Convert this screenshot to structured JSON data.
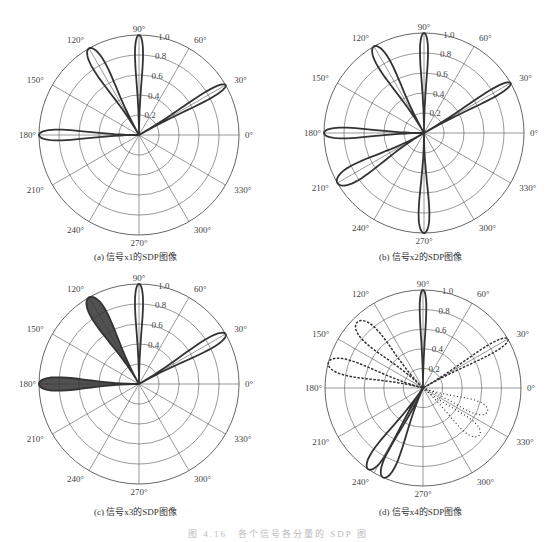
{
  "figure_caption": "图 4.16　各个信号各分量的 SDP 图",
  "chart_data": [
    {
      "type": "polar",
      "id": "a",
      "title": "(a) 信号x1的SDP图像",
      "center": [
        139,
        135
      ],
      "radius": 100,
      "angle_ticks": [
        "0°",
        "30°",
        "60°",
        "90°",
        "120°",
        "150°",
        "180°",
        "210°",
        "240°",
        "270°",
        "300°",
        "330°"
      ],
      "radial_ticks": [
        "0.2",
        "0.4",
        "0.6",
        "0.8",
        "1.0"
      ],
      "rlim": [
        0,
        1.0
      ],
      "lobes": [
        {
          "angle": 90,
          "r": 1.0,
          "width": 6,
          "style": "solid"
        },
        {
          "angle": 120,
          "r": 1.0,
          "width": 10,
          "style": "solid"
        },
        {
          "angle": 30,
          "r": 1.0,
          "width": 6,
          "style": "solid"
        },
        {
          "angle": 180,
          "r": 1.0,
          "width": 8,
          "style": "solid"
        }
      ]
    },
    {
      "type": "polar",
      "id": "b",
      "title": "(b) 信号x2的SDP图像",
      "center": [
        424,
        133
      ],
      "radius": 100,
      "angle_ticks": [
        "0°",
        "30°",
        "60°",
        "90°",
        "120°",
        "150°",
        "180°",
        "210°",
        "240°",
        "270°",
        "300°",
        "330°"
      ],
      "radial_ticks": [
        "0.2",
        "0.4",
        "0.6",
        "0.8",
        "1.0"
      ],
      "rlim": [
        0,
        1.0
      ],
      "lobes": [
        {
          "angle": 90,
          "r": 1.0,
          "width": 6,
          "style": "solid"
        },
        {
          "angle": 120,
          "r": 1.0,
          "width": 10,
          "style": "solid"
        },
        {
          "angle": 30,
          "r": 1.0,
          "width": 6,
          "style": "solid"
        },
        {
          "angle": 180,
          "r": 1.0,
          "width": 8,
          "style": "solid"
        },
        {
          "angle": 210,
          "r": 1.0,
          "width": 12,
          "style": "solid"
        },
        {
          "angle": 270,
          "r": 1.0,
          "width": 8,
          "style": "solid"
        }
      ]
    },
    {
      "type": "polar",
      "id": "c",
      "title": "(c) 信号x3的SDP图像",
      "center": [
        139,
        384
      ],
      "radius": 100,
      "angle_ticks": [
        "0°",
        "30°",
        "60°",
        "90°",
        "120°",
        "150°",
        "180°",
        "210°",
        "240°",
        "270°",
        "300°",
        "330°"
      ],
      "radial_ticks": [
        "0.4",
        "0.6",
        "0.8",
        "1.0"
      ],
      "rlim": [
        0,
        1.0
      ],
      "lobes": [
        {
          "angle": 90,
          "r": 1.0,
          "width": 6,
          "style": "solid"
        },
        {
          "angle": 30,
          "r": 1.0,
          "width": 8,
          "style": "solid"
        },
        {
          "angle": 120,
          "r": 1.0,
          "width": 12,
          "style": "filled"
        },
        {
          "angle": 180,
          "r": 1.0,
          "width": 10,
          "style": "filled"
        }
      ]
    },
    {
      "type": "polar",
      "id": "d",
      "title": "(d) 信号x4的SDP图像",
      "center": [
        423,
        388
      ],
      "radius": 98,
      "angle_ticks": [
        "0°",
        "30°",
        "60°",
        "90°",
        "120°",
        "150°",
        "180°",
        "210°",
        "240°",
        "270°",
        "300°",
        "330°"
      ],
      "radial_ticks": [
        "0.2",
        "0.4",
        "0.6",
        "0.8",
        "1.0"
      ],
      "rlim": [
        0,
        1.0
      ],
      "lobes": [
        {
          "angle": 90,
          "r": 1.0,
          "width": 5,
          "style": "solid"
        },
        {
          "angle": 30,
          "r": 1.0,
          "width": 7,
          "style": "dashed"
        },
        {
          "angle": 135,
          "r": 0.95,
          "width": 14,
          "style": "dashed"
        },
        {
          "angle": 165,
          "r": 1.0,
          "width": 12,
          "style": "dashed"
        },
        {
          "angle": 236,
          "r": 1.0,
          "width": 10,
          "style": "solid"
        },
        {
          "angle": 246,
          "r": 1.0,
          "width": 10,
          "style": "solid"
        },
        {
          "angle": 340,
          "r": 0.7,
          "width": 14,
          "style": "dotted"
        },
        {
          "angle": 320,
          "r": 0.75,
          "width": 14,
          "style": "dotted"
        }
      ]
    }
  ]
}
